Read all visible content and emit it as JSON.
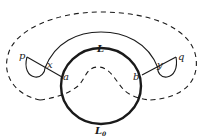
{
  "figure": {
    "type": "topological path diagram",
    "colors": {
      "ink": "#1a1a1a",
      "background": "#ffffff"
    }
  },
  "labels": {
    "p": "p",
    "x": "x",
    "a": "a",
    "L": "L",
    "b": "b",
    "y": "y",
    "q": "q",
    "L0_main": "L",
    "L0_sub": "0"
  },
  "elements": {
    "circle": "thick closed curve (L above, L0 below)",
    "thin_arc": "path L from x to y over the circle",
    "dashed_outer": "dashed closed loop surrounding figure",
    "dashed_inner": "dashed curve crossing circle from left to right",
    "loop_left": "small loop at p",
    "loop_right": "small loop at q"
  }
}
